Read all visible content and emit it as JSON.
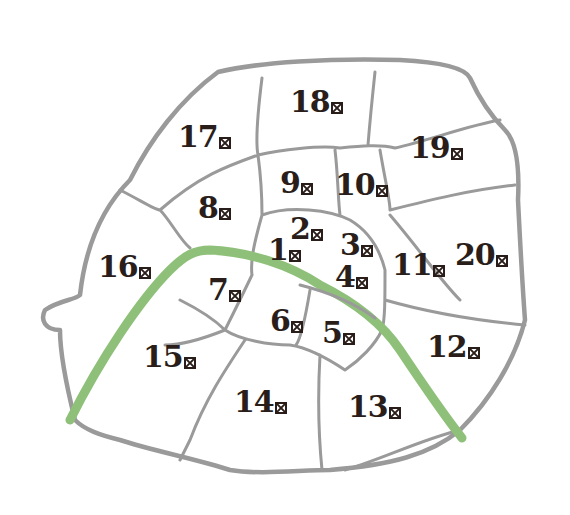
{
  "map": {
    "title": "Paris arrondissements",
    "colors": {
      "boundary": "#9a9a9a",
      "river": "#8fc07a",
      "label": "#2a1e1a",
      "background": "#ffffff"
    },
    "river_name": "Seine",
    "suffix_glyph": "e-box-icon",
    "arrondissements": [
      {
        "number": "1",
        "x": 268,
        "y": 235
      },
      {
        "number": "2",
        "x": 290,
        "y": 214
      },
      {
        "number": "3",
        "x": 340,
        "y": 230
      },
      {
        "number": "4",
        "x": 335,
        "y": 262
      },
      {
        "number": "5",
        "x": 322,
        "y": 318
      },
      {
        "number": "6",
        "x": 270,
        "y": 306
      },
      {
        "number": "7",
        "x": 208,
        "y": 275
      },
      {
        "number": "8",
        "x": 198,
        "y": 193
      },
      {
        "number": "9",
        "x": 280,
        "y": 168
      },
      {
        "number": "10",
        "x": 335,
        "y": 170
      },
      {
        "number": "11",
        "x": 392,
        "y": 250
      },
      {
        "number": "12",
        "x": 427,
        "y": 332
      },
      {
        "number": "13",
        "x": 348,
        "y": 392
      },
      {
        "number": "14",
        "x": 234,
        "y": 387
      },
      {
        "number": "15",
        "x": 143,
        "y": 342
      },
      {
        "number": "16",
        "x": 98,
        "y": 252
      },
      {
        "number": "17",
        "x": 178,
        "y": 122
      },
      {
        "number": "18",
        "x": 290,
        "y": 87
      },
      {
        "number": "19",
        "x": 410,
        "y": 133
      },
      {
        "number": "20",
        "x": 455,
        "y": 240
      }
    ]
  }
}
